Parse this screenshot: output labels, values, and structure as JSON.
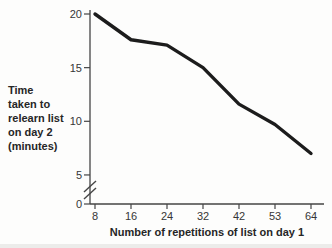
{
  "chart_data": {
    "type": "line",
    "title": "",
    "xlabel": "Number of repetitions of list on day 1",
    "ylabel": "Time taken to relearn list on day 2 (minutes)",
    "ylabel_wrapped": "Time\ntaken to\nrelearn list\non day 2\n(minutes)",
    "categories": [
      8,
      16,
      24,
      32,
      42,
      53,
      64
    ],
    "values": [
      20,
      17.6,
      17.1,
      15,
      11.6,
      9.7,
      7
    ],
    "yticks": [
      0,
      5,
      10,
      15,
      20
    ],
    "ylim": [
      0,
      20
    ],
    "y_axis_break": true,
    "grid": false,
    "legend": false,
    "line_color": "#1c1c1c",
    "axis_color": "#454545",
    "text_color": "#363636"
  }
}
